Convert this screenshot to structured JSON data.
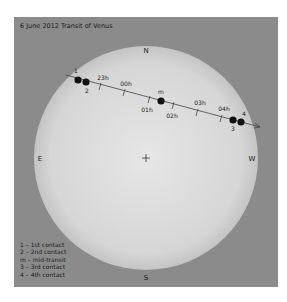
{
  "diagram": {
    "title": "6 June 2012 Transit of Venus",
    "compass": {
      "north": "N",
      "south": "S",
      "east": "E",
      "west": "W"
    },
    "center_marker": "+",
    "colors": {
      "background": "#8b8b8b",
      "sun_center": "#e6e6e6",
      "sun_edge": "#c7c7c7",
      "ink": "#1a1a1a"
    },
    "path": {
      "time_ticks": [
        "23h",
        "00h",
        "01h",
        "02h",
        "03h",
        "04h"
      ],
      "contacts": [
        {
          "label": "1",
          "description": "1st contact"
        },
        {
          "label": "2",
          "description": "2nd contact"
        },
        {
          "label": "m",
          "description": "mid-transit"
        },
        {
          "label": "3",
          "description": "3rd contact"
        },
        {
          "label": "4",
          "description": "4th contact"
        }
      ]
    },
    "legend": [
      "1 – 1st contact",
      "2 – 2nd contact",
      "m – mid-transit",
      "3 – 3rd contact",
      "4 – 4th contact"
    ]
  }
}
